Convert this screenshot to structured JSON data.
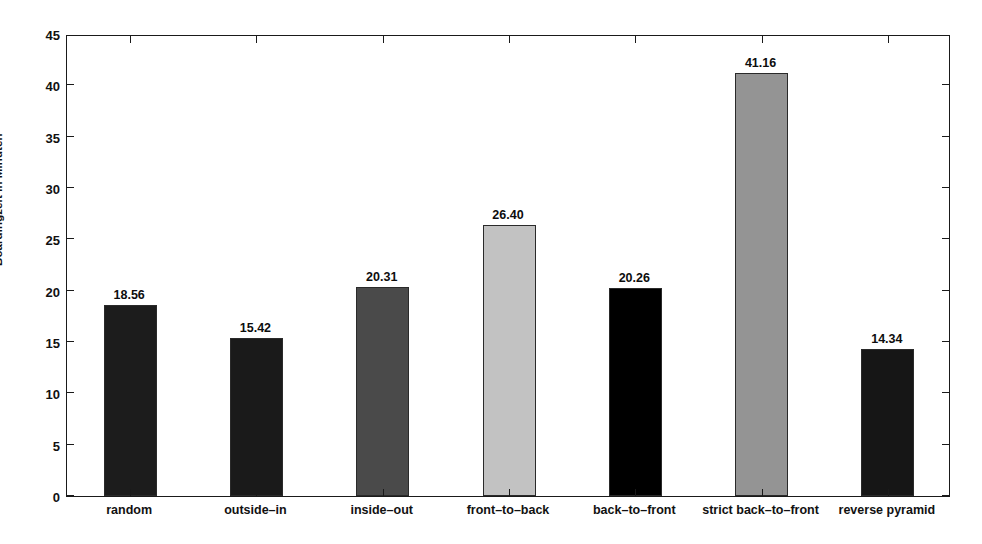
{
  "chart_data": {
    "type": "bar",
    "title": "",
    "xlabel": "",
    "ylabel": "Boardingzeit in Minuten",
    "ylim": [
      0,
      45
    ],
    "ytick_step": 5,
    "ytick_labels": [
      "0",
      "5",
      "10",
      "15",
      "20",
      "25",
      "30",
      "35",
      "40",
      "45"
    ],
    "grid": false,
    "legend": "none",
    "categories": [
      "random",
      "outside–in",
      "inside–out",
      "front–to–back",
      "back–to–front",
      "strict back–to–front",
      "reverse pyramid"
    ],
    "values": [
      18.56,
      15.42,
      20.31,
      26.4,
      20.26,
      41.16,
      14.34
    ],
    "value_labels": [
      "18.56",
      "15.42",
      "20.31",
      "26.40",
      "20.26",
      "41.16",
      "14.34"
    ],
    "bar_colors": [
      "#1c1c1c",
      "#1a1a1a",
      "#4a4a4a",
      "#c2c2c2",
      "#000000",
      "#949494",
      "#161616"
    ],
    "axis_color": "#1a1a1a",
    "background_color": "#ffffff"
  }
}
